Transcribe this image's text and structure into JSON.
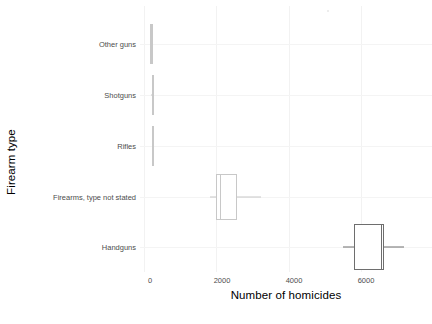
{
  "chart_data": {
    "type": "box",
    "orientation": "horizontal",
    "title": "",
    "xlabel": "Number of homicides",
    "ylabel": "Firearm type",
    "xlim": [
      -110,
      7950
    ],
    "xticks": [
      0,
      2000,
      4000,
      6000
    ],
    "xtick_labels": [
      "0",
      "2000",
      "4000",
      "6000"
    ],
    "categories": [
      "Handguns",
      "Firearms, type not stated",
      "Rifles",
      "Shotguns",
      "Other guns"
    ],
    "grid": "light gray vertical and horizontal gridlines",
    "legend": "none",
    "boxes": [
      {
        "category": "Handguns",
        "whisker_low": 5500,
        "q1": 5800,
        "median": 6540,
        "q3": 6620,
        "whisker_high": 7170,
        "color": "#6e6e6e"
      },
      {
        "category": "Firearms, type not stated",
        "whisker_low": 1830,
        "q1": 2000,
        "median": 2090,
        "q3": 2580,
        "whisker_high": 3220,
        "color": "#c8c8c8"
      },
      {
        "category": "Rifles",
        "whisker_low": 210,
        "q1": 215,
        "median": 235,
        "q3": 260,
        "whisker_high": 275,
        "color": "#c8c8c8"
      },
      {
        "category": "Shotguns",
        "whisker_low": 205,
        "q1": 210,
        "median": 230,
        "q3": 255,
        "whisker_high": 270,
        "color": "#c8c8c8"
      },
      {
        "category": "Other guns",
        "whisker_low": 165,
        "q1": 175,
        "median": 200,
        "q3": 225,
        "whisker_high": 240,
        "color": "#c8c8c8"
      }
    ]
  },
  "axes": {
    "x_title": "Number of homicides",
    "y_title": "Firearm type",
    "x_tick_labels": [
      "0",
      "2000",
      "4000",
      "6000"
    ],
    "y_tick_labels": [
      "Other guns",
      "Shotguns",
      "Rifles",
      "Firearms, type not stated",
      "Handguns"
    ]
  },
  "colors": {
    "background": "#ffffff",
    "gridline": "#f2f2f2",
    "text": "#4d4d4d",
    "title_text": "#000000",
    "box_dark": "#6e6e6e",
    "box_light": "#c8c8c8"
  }
}
